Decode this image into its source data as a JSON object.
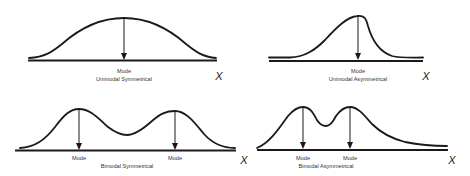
{
  "panels": [
    {
      "id": "unimodal-symmetrical",
      "title": "Unimodal Symmetrical",
      "mode_labels": [
        "Mode"
      ],
      "axis_label": "X"
    },
    {
      "id": "unimodal-asymmetrical",
      "title": "Unimodal Asymmetrical",
      "mode_labels": [
        "Mode"
      ],
      "axis_label": "X"
    },
    {
      "id": "bimodal-symmetrical",
      "title": "Bimodal Symmetrical",
      "mode_labels": [
        "Mode",
        "Mode"
      ],
      "axis_label": "X"
    },
    {
      "id": "bimodal-asymmetrical",
      "title": "Bimodal Asymmetrical",
      "mode_labels": [
        "Mode",
        "Mode"
      ],
      "axis_label": "X"
    }
  ],
  "colors": {
    "stroke": "#1a1a1a",
    "text": "#333333",
    "background": "#ffffff"
  }
}
